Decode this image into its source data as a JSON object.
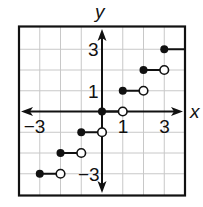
{
  "chart_data": {
    "type": "line",
    "subtype": "step",
    "title": "",
    "xlabel": "x",
    "ylabel": "y",
    "xlim": [
      -4,
      4
    ],
    "ylim": [
      -4,
      4
    ],
    "grid": true,
    "x_tick_labels": [
      {
        "value": -3,
        "label": "−3"
      },
      {
        "value": 1,
        "label": "1"
      },
      {
        "value": 3,
        "label": "3"
      }
    ],
    "y_tick_labels": [
      {
        "value": 3,
        "label": "3"
      },
      {
        "value": 1,
        "label": "1"
      },
      {
        "value": -3,
        "label": "−3"
      }
    ],
    "series": [
      {
        "name": "step function",
        "segments": [
          {
            "y": -3,
            "x_start": -3,
            "x_end": -2,
            "start": "closed",
            "end": "open"
          },
          {
            "y": -2,
            "x_start": -2,
            "x_end": -1,
            "start": "closed",
            "end": "open"
          },
          {
            "y": -1,
            "x_start": -1,
            "x_end": 0,
            "start": "closed",
            "end": "open"
          },
          {
            "y": 0,
            "x_start": 0,
            "x_end": 1,
            "start": "closed",
            "end": "open"
          },
          {
            "y": 1,
            "x_start": 1,
            "x_end": 2,
            "start": "closed",
            "end": "open"
          },
          {
            "y": 2,
            "x_start": 2,
            "x_end": 3,
            "start": "closed",
            "end": "open"
          },
          {
            "y": 3,
            "x_start": 3,
            "x_end": 4,
            "start": "closed",
            "end": "continues"
          }
        ]
      }
    ],
    "legend": null
  },
  "labels": {
    "x_axis": "x",
    "y_axis": "y"
  }
}
